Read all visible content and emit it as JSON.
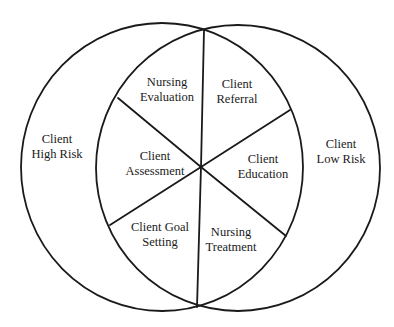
{
  "diagram": {
    "type": "venn-with-wheel",
    "stroke_color": "#1a1a1a",
    "background": "#ffffff",
    "circles": [
      {
        "name": "Client High Risk",
        "lines": [
          "Client",
          "High Risk"
        ]
      },
      {
        "name": "Client Low Risk",
        "lines": [
          "Client",
          "Low Risk"
        ]
      }
    ],
    "segments": [
      {
        "name": "Nursing Evaluation",
        "lines": [
          "Nursing",
          "Evaluation"
        ]
      },
      {
        "name": "Client Referral",
        "lines": [
          "Client",
          "Referral"
        ]
      },
      {
        "name": "Client Education",
        "lines": [
          "Client",
          "Education"
        ]
      },
      {
        "name": "Nursing Treatment",
        "lines": [
          "Nursing",
          "Treatment"
        ]
      },
      {
        "name": "Client Goal Setting",
        "lines": [
          "Client Goal",
          "Setting"
        ]
      },
      {
        "name": "Client Assessment",
        "lines": [
          "Client",
          "Assessment"
        ]
      }
    ]
  }
}
